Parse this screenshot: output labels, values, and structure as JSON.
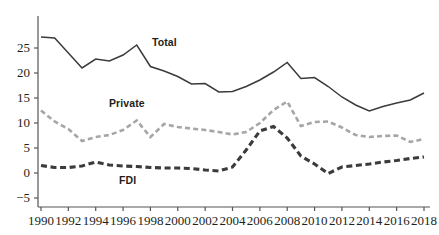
{
  "chart_data": {
    "type": "line",
    "title": "",
    "subtitle": "",
    "xlabel": "",
    "ylabel": "",
    "x": [
      1990,
      1991,
      1992,
      1993,
      1994,
      1995,
      1996,
      1997,
      1998,
      1999,
      2000,
      2001,
      2002,
      2003,
      2004,
      2005,
      2006,
      2007,
      2008,
      2009,
      2010,
      2011,
      2012,
      2013,
      2014,
      2015,
      2016,
      2017,
      2018
    ],
    "xlim": [
      1990,
      2018
    ],
    "ylim": [
      -5,
      28
    ],
    "yticks": [
      -5,
      0,
      5,
      10,
      15,
      20,
      25
    ],
    "xticks": [
      1990,
      1992,
      1994,
      1996,
      1998,
      2000,
      2002,
      2004,
      2006,
      2008,
      2010,
      2012,
      2014,
      2016,
      2018
    ],
    "grid": false,
    "legend_position": "inline-annotations",
    "series": [
      {
        "name": "Total",
        "style": "solid",
        "color": "#3b3b3b",
        "values": [
          27.2,
          27.0,
          24.0,
          21.0,
          22.8,
          22.4,
          23.6,
          25.6,
          21.3,
          20.4,
          19.3,
          17.8,
          17.9,
          16.2,
          16.3,
          17.3,
          18.6,
          20.2,
          22.1,
          18.9,
          19.1,
          17.3,
          15.2,
          13.6,
          12.4,
          13.3,
          14.0,
          14.6,
          16.0
        ]
      },
      {
        "name": "Private",
        "style": "dashed",
        "color": "#a6a6a6",
        "values": [
          12.5,
          10.3,
          8.8,
          6.4,
          7.2,
          7.6,
          8.6,
          10.5,
          7.2,
          9.8,
          9.2,
          8.9,
          8.6,
          8.2,
          7.7,
          8.2,
          10.0,
          12.6,
          14.3,
          9.4,
          10.2,
          10.3,
          9.1,
          7.6,
          7.2,
          7.4,
          7.5,
          6.2,
          6.8
        ]
      },
      {
        "name": "FDI",
        "style": "dashed-heavy",
        "color": "#3b3b3b",
        "values": [
          1.5,
          1.1,
          1.1,
          1.4,
          2.2,
          1.6,
          1.4,
          1.3,
          1.1,
          1.0,
          1.0,
          0.9,
          0.6,
          0.4,
          1.2,
          4.6,
          8.4,
          9.3,
          7.0,
          3.4,
          1.8,
          -0.1,
          1.2,
          1.5,
          1.8,
          2.2,
          2.5,
          2.9,
          3.2
        ]
      }
    ],
    "annotations": [
      {
        "text": "Total",
        "x_px": 152,
        "y_px": 36,
        "series": "Total"
      },
      {
        "text": "Private",
        "x_px": 109,
        "y_px": 97,
        "series": "Private"
      },
      {
        "text": "FDI",
        "x_px": 119,
        "y_px": 174,
        "series": "FDI"
      }
    ]
  },
  "axis": {
    "y_tick_labels": [
      "25",
      "20",
      "15",
      "10",
      "5",
      "0",
      "−5"
    ],
    "x_tick_labels": [
      "1990",
      "1992",
      "1994",
      "1996",
      "1998",
      "2000",
      "2002",
      "2004",
      "2006",
      "2008",
      "2010",
      "2012",
      "2014",
      "2016",
      "2018"
    ]
  },
  "colors": {
    "total": "#3b3b3b",
    "private": "#a6a6a6",
    "fdi": "#3b3b3b",
    "axis": "#555555",
    "text": "#231f20",
    "background": "#ffffff"
  }
}
